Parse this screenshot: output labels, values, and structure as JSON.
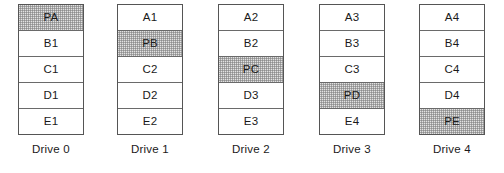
{
  "diagram": {
    "block_height_px": 26,
    "colors": {
      "border": "#555555",
      "divider": "#6a6a6a",
      "block_fill": "#ffffff",
      "parity_fill": "#e2e2e2",
      "text": "#1a1a1a",
      "background": "#ffffff"
    },
    "drives": [
      {
        "caption": "Drive 0",
        "left_px": 18,
        "blocks": [
          {
            "label": "PA",
            "parity": true
          },
          {
            "label": "B1",
            "parity": false
          },
          {
            "label": "C1",
            "parity": false
          },
          {
            "label": "D1",
            "parity": false
          },
          {
            "label": "E1",
            "parity": false
          }
        ]
      },
      {
        "caption": "Drive 1",
        "left_px": 117,
        "blocks": [
          {
            "label": "A1",
            "parity": false
          },
          {
            "label": "PB",
            "parity": true
          },
          {
            "label": "C2",
            "parity": false
          },
          {
            "label": "D2",
            "parity": false
          },
          {
            "label": "E2",
            "parity": false
          }
        ]
      },
      {
        "caption": "Drive 2",
        "left_px": 218,
        "blocks": [
          {
            "label": "A2",
            "parity": false
          },
          {
            "label": "B2",
            "parity": false
          },
          {
            "label": "PC",
            "parity": true
          },
          {
            "label": "D3",
            "parity": false
          },
          {
            "label": "E3",
            "parity": false
          }
        ]
      },
      {
        "caption": "Drive 3",
        "left_px": 319,
        "blocks": [
          {
            "label": "A3",
            "parity": false
          },
          {
            "label": "B3",
            "parity": false
          },
          {
            "label": "C3",
            "parity": false
          },
          {
            "label": "PD",
            "parity": true
          },
          {
            "label": "E4",
            "parity": false
          }
        ]
      },
      {
        "caption": "Drive 4",
        "left_px": 419,
        "blocks": [
          {
            "label": "A4",
            "parity": false
          },
          {
            "label": "B4",
            "parity": false
          },
          {
            "label": "C4",
            "parity": false
          },
          {
            "label": "D4",
            "parity": false
          },
          {
            "label": "PE",
            "parity": true
          }
        ]
      }
    ]
  }
}
